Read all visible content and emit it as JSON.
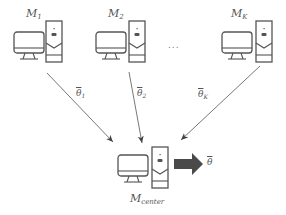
{
  "diagram": {
    "clients": [
      {
        "id": "client-1",
        "label_base": "M",
        "label_sub": "1",
        "param_base": "θ",
        "param_sub": "1"
      },
      {
        "id": "client-2",
        "label_base": "M",
        "label_sub": "2",
        "param_base": "θ",
        "param_sub": "2"
      },
      {
        "id": "client-k",
        "label_base": "M",
        "label_sub": "K",
        "param_base": "θ",
        "param_sub": "K"
      }
    ],
    "ellipsis": "...",
    "center": {
      "label_base": "M",
      "label_sub": "center",
      "output_base": "θ"
    },
    "colors": {
      "stroke": "#555555",
      "arrow": "#444444",
      "thick_arrow": "#4a4a4a"
    }
  }
}
